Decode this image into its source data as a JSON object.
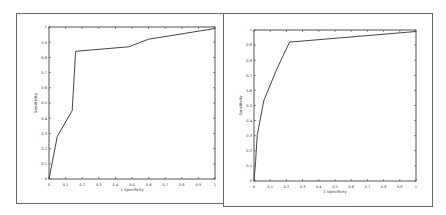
{
  "chart_data": [
    {
      "type": "line",
      "title": "",
      "xlabel": "1-Specificity",
      "ylabel": "Sensitivity",
      "xlim": [
        0,
        1
      ],
      "ylim": [
        0,
        1
      ],
      "grid": false,
      "xticks": [
        "0",
        "0.1",
        "0.2",
        "0.3",
        "0.4",
        "0.5",
        "0.6",
        "0.7",
        "0.8",
        "0.9",
        "1"
      ],
      "yticks": [
        "0",
        "0.1",
        "0.2",
        "0.3",
        "0.4",
        "0.5",
        "0.6",
        "0.7",
        "0.8",
        "0.9",
        "1"
      ],
      "series": [
        {
          "name": "ROC",
          "x": [
            0,
            0.05,
            0.14,
            0.16,
            0.48,
            0.6,
            1.0
          ],
          "y": [
            0,
            0.28,
            0.45,
            0.84,
            0.87,
            0.92,
            0.99
          ]
        }
      ]
    },
    {
      "type": "line",
      "title": "",
      "xlabel": "1-Specificity",
      "ylabel": "Sensitivity",
      "xlim": [
        0,
        1
      ],
      "ylim": [
        0,
        1
      ],
      "grid": false,
      "xticks": [
        "0",
        "0.1",
        "0.2",
        "0.3",
        "0.4",
        "0.5",
        "0.6",
        "0.7",
        "0.8",
        "0.9",
        "1"
      ],
      "yticks": [
        "0",
        "0.1",
        "0.2",
        "0.3",
        "0.4",
        "0.5",
        "0.6",
        "0.7",
        "0.8",
        "0.9",
        "1"
      ],
      "series": [
        {
          "name": "ROC",
          "x": [
            0,
            0.01,
            0.02,
            0.06,
            0.14,
            0.22,
            1.0
          ],
          "y": [
            0,
            0.13,
            0.3,
            0.53,
            0.74,
            0.92,
            0.99
          ]
        }
      ]
    }
  ],
  "colors": {
    "line": "#444444",
    "axis": "#555555",
    "border": "#6a6a6a"
  }
}
